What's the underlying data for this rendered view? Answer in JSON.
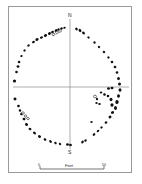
{
  "figure": {
    "kind": "archaeological-site-plan",
    "frame_color": "#9a9a9a",
    "background_color": "#ffffff",
    "stone_fill_color": "#111111",
    "fallen_stone_fill_color": "#ffffff",
    "fallen_stone_stroke_color": "#111111",
    "axis_color": "#8a8a8a"
  },
  "orientation": {
    "north_label": "N",
    "south_label": "S"
  },
  "scale": {
    "left_tick_label": "0",
    "right_tick_label": "50",
    "unit_label": "Feet"
  },
  "chart_data": {
    "type": "scatter",
    "title": "",
    "xlabel": "",
    "ylabel": "",
    "xlim": [
      0,
      142
    ],
    "ylim": [
      0,
      184
    ],
    "grid": false,
    "legend": null,
    "axes_lines": [
      {
        "name": "north-south-axis",
        "x1": 70.0,
        "y1": 19.0,
        "x2": 70.0,
        "y2": 149.0
      },
      {
        "name": "east-west-axis",
        "x1": 13.0,
        "y1": 87.0,
        "x2": 129.0,
        "y2": 87.0
      }
    ],
    "series": [
      {
        "name": "standing-stones",
        "marker": "filled",
        "points": [
          {
            "x": 33.5,
            "y": 42.0,
            "w": 3.0,
            "h": 2.4,
            "r": -25
          },
          {
            "x": 37.0,
            "y": 39.5,
            "w": 3.4,
            "h": 2.6,
            "r": -25
          },
          {
            "x": 41.5,
            "y": 37.5,
            "w": 3.2,
            "h": 2.4,
            "r": -28
          },
          {
            "x": 45.5,
            "y": 35.5,
            "w": 3.4,
            "h": 2.6,
            "r": -28
          },
          {
            "x": 49.5,
            "y": 33.5,
            "w": 3.2,
            "h": 2.6,
            "r": -30
          },
          {
            "x": 52.5,
            "y": 32.0,
            "w": 3.0,
            "h": 2.4,
            "r": -30
          },
          {
            "x": 56.0,
            "y": 30.5,
            "w": 3.2,
            "h": 2.4,
            "r": -32
          },
          {
            "x": 58.5,
            "y": 29.5,
            "w": 2.6,
            "h": 2.2,
            "r": -32
          },
          {
            "x": 61.5,
            "y": 28.5,
            "w": 2.8,
            "h": 2.2,
            "r": -35
          },
          {
            "x": 64.5,
            "y": 27.8,
            "w": 2.6,
            "h": 2.0,
            "r": -35
          },
          {
            "x": 28.5,
            "y": 45.5,
            "w": 2.6,
            "h": 2.2,
            "r": -20
          },
          {
            "x": 24.5,
            "y": 50.5,
            "w": 2.4,
            "h": 2.2,
            "r": -15
          },
          {
            "x": 21.5,
            "y": 56.0,
            "w": 2.4,
            "h": 2.2,
            "r": -10
          },
          {
            "x": 19.0,
            "y": 62.0,
            "w": 2.6,
            "h": 2.4,
            "r": -5
          },
          {
            "x": 18.0,
            "y": 66.5,
            "w": 2.8,
            "h": 2.6,
            "r": 0
          },
          {
            "x": 16.5,
            "y": 72.0,
            "w": 2.6,
            "h": 2.4,
            "r": 0
          },
          {
            "x": 14.5,
            "y": 81.0,
            "w": 3.2,
            "h": 3.0,
            "r": 0
          },
          {
            "x": 15.0,
            "y": 99.0,
            "w": 3.0,
            "h": 2.8,
            "r": 0
          },
          {
            "x": 18.5,
            "y": 106.0,
            "w": 2.8,
            "h": 2.6,
            "r": 10
          },
          {
            "x": 20.0,
            "y": 110.5,
            "w": 2.6,
            "h": 2.4,
            "r": 12
          },
          {
            "x": 21.5,
            "y": 114.0,
            "w": 2.8,
            "h": 2.6,
            "r": 15
          },
          {
            "x": 24.0,
            "y": 119.0,
            "w": 3.0,
            "h": 2.6,
            "r": 20
          },
          {
            "x": 26.5,
            "y": 124.5,
            "w": 3.2,
            "h": 2.6,
            "r": 25
          },
          {
            "x": 30.0,
            "y": 129.0,
            "w": 3.0,
            "h": 2.4,
            "r": 30
          },
          {
            "x": 34.5,
            "y": 133.0,
            "w": 3.2,
            "h": 2.4,
            "r": 35
          },
          {
            "x": 39.5,
            "y": 136.5,
            "w": 3.4,
            "h": 2.6,
            "r": 40
          },
          {
            "x": 45.0,
            "y": 139.5,
            "w": 3.0,
            "h": 2.4,
            "r": 45
          },
          {
            "x": 50.5,
            "y": 141.5,
            "w": 3.0,
            "h": 2.4,
            "r": 50
          },
          {
            "x": 55.5,
            "y": 143.0,
            "w": 2.8,
            "h": 2.2,
            "r": 55
          },
          {
            "x": 60.0,
            "y": 144.0,
            "w": 2.6,
            "h": 2.2,
            "r": 60
          },
          {
            "x": 67.5,
            "y": 144.5,
            "w": 3.0,
            "h": 2.6,
            "r": 0
          },
          {
            "x": 70.5,
            "y": 145.0,
            "w": 2.8,
            "h": 2.4,
            "r": 0
          },
          {
            "x": 82.5,
            "y": 142.0,
            "w": 3.0,
            "h": 2.4,
            "r": -55
          },
          {
            "x": 85.5,
            "y": 140.5,
            "w": 2.8,
            "h": 2.2,
            "r": -55
          },
          {
            "x": 94.0,
            "y": 134.5,
            "w": 3.0,
            "h": 2.4,
            "r": -45
          },
          {
            "x": 98.0,
            "y": 131.0,
            "w": 2.8,
            "h": 2.2,
            "r": -40
          },
          {
            "x": 101.5,
            "y": 127.5,
            "w": 2.6,
            "h": 2.2,
            "r": -38
          },
          {
            "x": 106.0,
            "y": 122.5,
            "w": 2.8,
            "h": 2.4,
            "r": -32
          },
          {
            "x": 110.0,
            "y": 117.0,
            "w": 3.0,
            "h": 2.6,
            "r": -25
          },
          {
            "x": 112.5,
            "y": 112.5,
            "w": 3.2,
            "h": 2.8,
            "r": -20
          },
          {
            "x": 115.5,
            "y": 108.0,
            "w": 3.0,
            "h": 3.8,
            "r": -12
          },
          {
            "x": 117.0,
            "y": 102.0,
            "w": 3.4,
            "h": 4.2,
            "r": -5
          },
          {
            "x": 118.5,
            "y": 96.0,
            "w": 3.0,
            "h": 3.6,
            "r": 0
          },
          {
            "x": 120.0,
            "y": 90.0,
            "w": 3.0,
            "h": 3.4,
            "r": 0
          },
          {
            "x": 119.5,
            "y": 84.0,
            "w": 3.0,
            "h": 3.2,
            "r": 0
          },
          {
            "x": 118.5,
            "y": 78.5,
            "w": 2.8,
            "h": 3.0,
            "r": 0
          },
          {
            "x": 117.0,
            "y": 72.5,
            "w": 2.6,
            "h": 2.6,
            "r": 0
          },
          {
            "x": 115.0,
            "y": 67.0,
            "w": 2.8,
            "h": 2.6,
            "r": 8
          },
          {
            "x": 112.0,
            "y": 62.0,
            "w": 2.6,
            "h": 2.4,
            "r": 12
          },
          {
            "x": 108.5,
            "y": 57.5,
            "w": 2.4,
            "h": 2.2,
            "r": 18
          },
          {
            "x": 104.0,
            "y": 52.0,
            "w": 2.6,
            "h": 2.4,
            "r": 25
          },
          {
            "x": 99.0,
            "y": 47.0,
            "w": 2.4,
            "h": 2.2,
            "r": 30
          },
          {
            "x": 94.5,
            "y": 42.5,
            "w": 2.6,
            "h": 2.2,
            "r": 35
          },
          {
            "x": 88.5,
            "y": 37.5,
            "w": 2.6,
            "h": 2.2,
            "r": 42
          },
          {
            "x": 83.5,
            "y": 33.0,
            "w": 3.2,
            "h": 2.6,
            "r": 48
          },
          {
            "x": 80.0,
            "y": 30.5,
            "w": 3.4,
            "h": 2.6,
            "r": 52
          },
          {
            "x": 76.5,
            "y": 29.0,
            "w": 3.0,
            "h": 2.4,
            "r": 55
          },
          {
            "x": 101.0,
            "y": 92.5,
            "w": 2.6,
            "h": 2.2,
            "r": 0
          },
          {
            "x": 104.5,
            "y": 94.5,
            "w": 2.8,
            "h": 2.4,
            "r": 10
          },
          {
            "x": 108.0,
            "y": 96.0,
            "w": 2.6,
            "h": 2.4,
            "r": 15
          },
          {
            "x": 111.0,
            "y": 99.5,
            "w": 3.0,
            "h": 3.4,
            "r": 0
          },
          {
            "x": 112.0,
            "y": 105.0,
            "w": 3.2,
            "h": 3.6,
            "r": 0
          },
          {
            "x": 99.5,
            "y": 104.0,
            "w": 2.6,
            "h": 2.2,
            "r": 0
          },
          {
            "x": 96.5,
            "y": 103.0,
            "w": 2.4,
            "h": 2.2,
            "r": 0
          },
          {
            "x": 97.0,
            "y": 99.0,
            "w": 2.2,
            "h": 2.6,
            "r": 0
          },
          {
            "x": 108.5,
            "y": 88.5,
            "w": 3.0,
            "h": 2.4,
            "r": 0
          },
          {
            "x": 112.0,
            "y": 88.0,
            "w": 3.0,
            "h": 2.4,
            "r": 0
          },
          {
            "x": 91.5,
            "y": 122.0,
            "w": 2.4,
            "h": 2.2,
            "r": 0
          }
        ]
      },
      {
        "name": "fallen-or-recumbent-stones",
        "marker": "open",
        "points": [
          {
            "x": 53.5,
            "y": 34.5,
            "w": 2.8,
            "h": 2.4,
            "r": -30
          },
          {
            "x": 57.0,
            "y": 32.5,
            "w": 2.6,
            "h": 2.4,
            "r": -30
          },
          {
            "x": 60.0,
            "y": 31.0,
            "w": 2.8,
            "h": 2.4,
            "r": -32
          },
          {
            "x": 23.0,
            "y": 113.0,
            "w": 2.6,
            "h": 2.2,
            "r": 15
          },
          {
            "x": 25.5,
            "y": 116.0,
            "w": 2.4,
            "h": 2.2,
            "r": 18
          },
          {
            "x": 28.0,
            "y": 118.5,
            "w": 2.6,
            "h": 2.2,
            "r": 20
          },
          {
            "x": 95.0,
            "y": 96.5,
            "w": 3.0,
            "h": 2.6,
            "r": 0
          }
        ]
      }
    ]
  }
}
